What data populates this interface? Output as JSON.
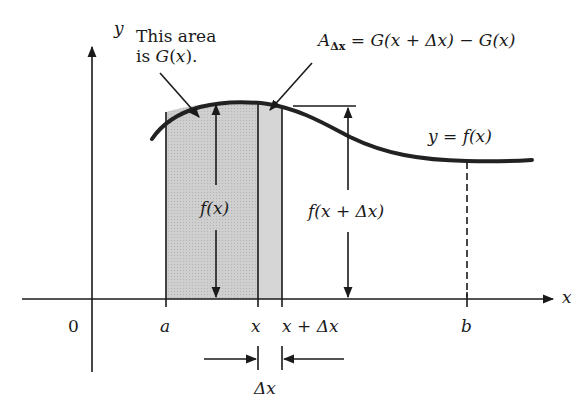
{
  "diagram": {
    "axes": {
      "x_label": "x",
      "y_label": "y",
      "origin_label": "0"
    },
    "curve_label": "y = f(x)",
    "annotations": {
      "area_label_line1": "This area",
      "area_label_line2": "is G(x).",
      "delta_area_label": "A_Δx = G(x + Δx) − G(x)",
      "delta_area_A": "A",
      "delta_area_sub": "Δx",
      "delta_area_rhs": "= G(x + Δx) − G(x)",
      "height_fx": "f(x)",
      "height_fxdx": "f(x + Δx)",
      "delta_x": "Δx"
    },
    "tick_labels": {
      "a": "a",
      "x": "x",
      "x_plus_dx": "x + Δx",
      "b": "b"
    },
    "colors": {
      "ink": "#1a1a1a",
      "shade": "#c9c9c9",
      "background": "#ffffff"
    }
  }
}
